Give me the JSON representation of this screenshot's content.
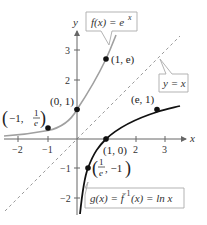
{
  "figure": {
    "axes": {
      "x_label": "x",
      "y_label": "y",
      "x_ticks": [
        "−2",
        "−1",
        "2",
        "3"
      ],
      "y_ticks": [
        "3",
        "2",
        "−1",
        "−2"
      ]
    },
    "curves": {
      "f": {
        "label": "f(x) = e^x",
        "label_main": "f(x) = e",
        "label_sup": "x",
        "color": "#a0a0a0"
      },
      "g": {
        "label": "g(x) = f^{-1}(x) = ln x",
        "label_main_1": "g(x) = f",
        "label_sup": "−1",
        "label_main_2": "(x) = ln x",
        "color": "#111111"
      },
      "identity": {
        "label": "y = x",
        "color": "#9a9a9a"
      }
    },
    "points": {
      "p_neg1_inv_e": {
        "text_pre": "−1, ",
        "num": "1",
        "den": "e"
      },
      "p_0_1": "(0, 1)",
      "p_1_e": "(1, e)",
      "p_e_1": "(e, 1)",
      "p_1_0": "(1, 0)",
      "p_inv_e_neg1": {
        "num": "1",
        "den": "e",
        "text_post": ", −1"
      }
    }
  }
}
